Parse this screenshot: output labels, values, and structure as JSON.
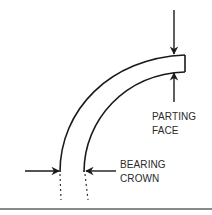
{
  "diagram": {
    "labels": {
      "parting_face": [
        "PARTING",
        "FACE"
      ],
      "bearing_crown": [
        "BEARING",
        "CROWN"
      ]
    },
    "colors": {
      "stroke": "#1a1a1a",
      "text": "#2a2a2a",
      "rule": "#8a8a8a",
      "background": "#ffffff"
    },
    "arrows": [
      {
        "name": "parting-face-top-arrow",
        "direction": "down"
      },
      {
        "name": "parting-face-bottom-arrow",
        "direction": "up"
      },
      {
        "name": "bearing-crown-outer-arrow",
        "direction": "right"
      },
      {
        "name": "bearing-crown-inner-arrow",
        "direction": "left"
      }
    ]
  }
}
